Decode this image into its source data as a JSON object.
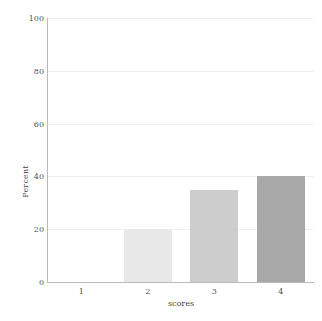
{
  "chart_data": {
    "type": "bar",
    "title": "",
    "xlabel": "scores",
    "ylabel": "Percent",
    "categories": [
      "1",
      "2",
      "3",
      "4"
    ],
    "values": [
      0,
      20,
      35,
      40
    ],
    "ylim": [
      0,
      100
    ],
    "yticks": [
      0,
      20,
      40,
      60,
      80,
      100
    ],
    "ytick_labels": [
      "0",
      "20",
      "40",
      "60",
      "80",
      "100"
    ],
    "xtick_labels": [
      "1",
      "2",
      "3",
      "4"
    ],
    "grid": "horizontal",
    "legend": "none",
    "bar_colors": [
      "#f7f7f7",
      "#e8e8e8",
      "#cdcdcd",
      "#a8a8a8"
    ],
    "background_color": "#ffffff",
    "axis_color": "#b9b9b9",
    "gridline_color": "#f0eeee",
    "text_color": "#555555"
  }
}
